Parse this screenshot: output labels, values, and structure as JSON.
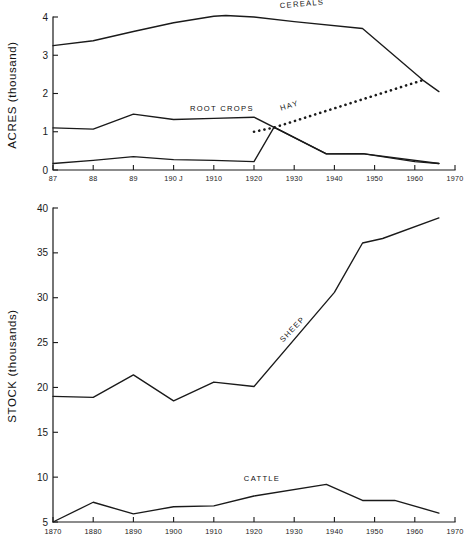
{
  "figure": {
    "background": "#ffffff",
    "ink_color": "#1a1a1a"
  },
  "chart_data": [
    {
      "id": "acreage",
      "type": "line",
      "title": "",
      "xlabel": "",
      "ylabel": "ACRES (thousand)",
      "xlim": [
        1870,
        1970
      ],
      "ylim": [
        0,
        4
      ],
      "grid": false,
      "legend": "inline-labels",
      "xticks": [
        1870,
        1880,
        1890,
        1900,
        1910,
        1920,
        1930,
        1940,
        1950,
        1960,
        1970
      ],
      "xticklabels": [
        "87",
        "88",
        "89",
        "190 J",
        "1910",
        "1920",
        "1930",
        "1940",
        "1950",
        "1960",
        "1970"
      ],
      "yticks": [
        0,
        1,
        2,
        3,
        4
      ],
      "yticklabels": [
        "0",
        "1",
        "2",
        "3",
        "4"
      ],
      "series": [
        {
          "name": "CEREALS",
          "style": "solid",
          "label_x": 1932,
          "label_y": 4.28,
          "label_rotate": -5,
          "x": [
            1870,
            1880,
            1890,
            1900,
            1910,
            1913,
            1920,
            1930,
            1947,
            1962,
            1966
          ],
          "y": [
            3.25,
            3.38,
            3.62,
            3.85,
            4.02,
            4.04,
            4.0,
            3.88,
            3.7,
            2.35,
            2.05
          ]
        },
        {
          "name": "ROOT CROPS",
          "style": "solid",
          "label_x": 1912,
          "label_y": 1.55,
          "label_rotate": 0,
          "x": [
            1870,
            1880,
            1890,
            1900,
            1910,
            1920,
            1938,
            1947,
            1960,
            1966
          ],
          "y": [
            1.1,
            1.07,
            1.46,
            1.32,
            1.35,
            1.38,
            0.42,
            0.43,
            0.22,
            0.17
          ]
        },
        {
          "name": "HAY",
          "style": "dotted",
          "label_x": 1929,
          "label_y": 1.62,
          "label_rotate": -17,
          "x": [
            1920,
            1925,
            1962
          ],
          "y": [
            1.0,
            1.11,
            2.35
          ]
        },
        {
          "name": "",
          "style": "solid",
          "label_x": null,
          "label_y": null,
          "label_rotate": 0,
          "x": [
            1870,
            1880,
            1890,
            1900,
            1910,
            1920,
            1925,
            1938,
            1947,
            1966
          ],
          "y": [
            0.17,
            0.25,
            0.35,
            0.27,
            0.25,
            0.22,
            1.12,
            0.42,
            0.43,
            0.17
          ]
        }
      ]
    },
    {
      "id": "livestock",
      "type": "line",
      "title": "",
      "xlabel": "",
      "ylabel": "STOCK (thousands)",
      "xlim": [
        1870,
        1970
      ],
      "ylim": [
        5,
        40
      ],
      "grid": false,
      "legend": "inline-labels",
      "xticks": [
        1870,
        1880,
        1890,
        1900,
        1910,
        1920,
        1930,
        1940,
        1950,
        1960,
        1970
      ],
      "xticklabels": [
        "1870",
        "1880",
        "1890",
        "1900",
        "1910",
        "1920",
        "1930",
        "1940",
        "1950",
        "1960",
        "1970"
      ],
      "yticks": [
        5,
        10,
        15,
        20,
        25,
        30,
        35,
        40
      ],
      "yticklabels": [
        "5",
        "10",
        "15",
        "20",
        "25",
        "30",
        "35",
        "40"
      ],
      "series": [
        {
          "name": "SHEEP",
          "style": "solid",
          "label_x": 1930,
          "label_y": 26.3,
          "label_rotate": -46,
          "x": [
            1870,
            1880,
            1890,
            1900,
            1910,
            1920,
            1940,
            1947,
            1952,
            1966
          ],
          "y": [
            19.0,
            18.9,
            21.4,
            18.5,
            20.6,
            20.1,
            30.6,
            36.1,
            36.6,
            38.9
          ]
        },
        {
          "name": "CATTLE",
          "style": "solid",
          "label_x": 1922,
          "label_y": 9.6,
          "label_rotate": 0,
          "x": [
            1870,
            1880,
            1890,
            1900,
            1910,
            1920,
            1938,
            1947,
            1955,
            1966
          ],
          "y": [
            5.0,
            7.2,
            5.9,
            6.7,
            6.8,
            7.9,
            9.2,
            7.4,
            7.4,
            6.0
          ]
        }
      ]
    }
  ]
}
